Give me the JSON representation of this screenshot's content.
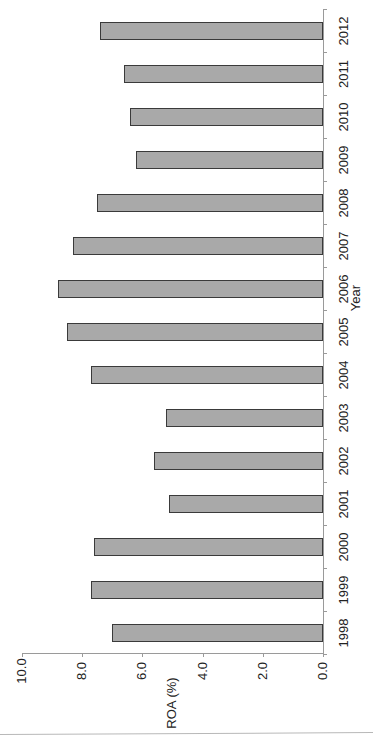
{
  "chart_data": {
    "type": "bar",
    "orientation": "vertical bars (image rotated 90° counter-clockwise)",
    "title": "",
    "xlabel": "Year",
    "ylabel": "ROA (%)",
    "categories": [
      "1998",
      "1999",
      "2000",
      "2001",
      "2002",
      "2003",
      "2004",
      "2005",
      "2006",
      "2007",
      "2008",
      "2009",
      "2010",
      "2011",
      "2012"
    ],
    "values": [
      7.0,
      7.7,
      7.6,
      5.1,
      5.6,
      5.2,
      7.7,
      8.5,
      8.8,
      8.3,
      7.5,
      6.2,
      6.4,
      6.6,
      7.4
    ],
    "ylim": [
      0,
      10
    ],
    "yticks": [
      "0.0",
      "2.0",
      "4.0",
      "6.0",
      "8.0",
      "10.0"
    ],
    "grid": false,
    "legend": null,
    "bar_color": "#a9a9a9",
    "bar_edge_color": "#3a3a3a"
  },
  "axis": {
    "x_title": "Year",
    "y_title": "ROA (%)"
  }
}
